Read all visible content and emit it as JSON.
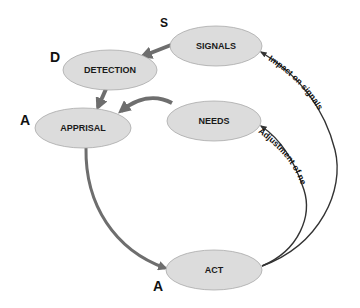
{
  "diagram": {
    "nodes": {
      "signals": {
        "label": "SIGNALS",
        "letter": "S"
      },
      "detection": {
        "label": "DETECTION",
        "letter": "D"
      },
      "apprisal": {
        "label": "APPRISAL",
        "letter": "A"
      },
      "needs": {
        "label": "NEEDS"
      },
      "act": {
        "label": "ACT",
        "letter": "A"
      }
    },
    "edges": [
      {
        "from": "SIGNALS",
        "to": "DETECTION"
      },
      {
        "from": "DETECTION",
        "to": "APPRISAL"
      },
      {
        "from": "NEEDS",
        "to": "APPRISAL"
      },
      {
        "from": "APPRISAL",
        "to": "ACT"
      },
      {
        "from": "ACT",
        "to": "NEEDS",
        "label": "Adjustment of needs"
      },
      {
        "from": "ACT",
        "to": "SIGNALS",
        "label": "Impact on signals"
      }
    ],
    "colors": {
      "node_fill": "#dcdcdc",
      "node_stroke": "#a9a9a9",
      "thick_arrow": "#6e6e6e",
      "thin_arrow": "#333333"
    }
  }
}
